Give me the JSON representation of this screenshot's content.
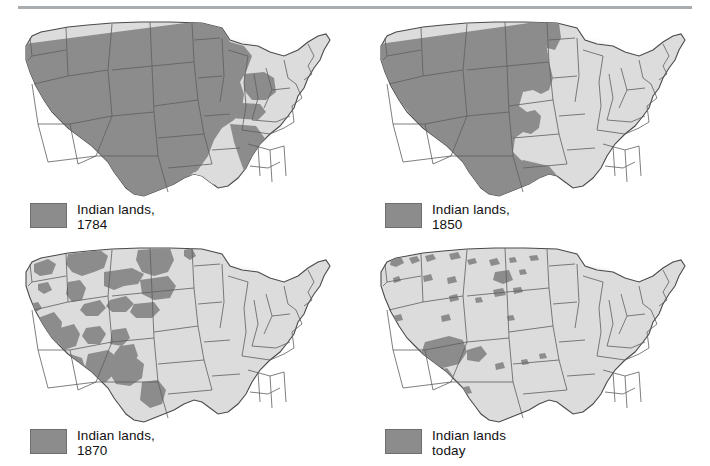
{
  "figure": {
    "type": "map-series",
    "rule_color": "#a9adb0",
    "background": "#ffffff"
  },
  "colors": {
    "indian_lands_fill": "#8c8c8c",
    "other_lands_fill": "#dcdcdc",
    "border_stroke": "#5e5e5e",
    "outline_stroke": "#4a4a4a",
    "lake_shadow": "#e4e4e4",
    "legend_text": "#111111"
  },
  "panels": [
    {
      "id": "map-1784",
      "legend": {
        "swatch_name": "indian-lands-swatch",
        "label": "Indian lands,\n1784",
        "label_line1": "Indian lands,",
        "label_line2": "1784"
      },
      "year": "1784"
    },
    {
      "id": "map-1850",
      "legend": {
        "swatch_name": "indian-lands-swatch",
        "label": "Indian lands,\n1850",
        "label_line1": "Indian lands,",
        "label_line2": "1850"
      },
      "year": "1850"
    },
    {
      "id": "map-1870",
      "legend": {
        "swatch_name": "indian-lands-swatch",
        "label": "Indian lands,\n1870",
        "label_line1": "Indian lands,",
        "label_line2": "1870"
      },
      "year": "1870"
    },
    {
      "id": "map-today",
      "legend": {
        "swatch_name": "indian-lands-swatch",
        "label": "Indian lands\ntoday",
        "label_line1": "Indian lands",
        "label_line2": "today"
      },
      "year": "today"
    }
  ]
}
